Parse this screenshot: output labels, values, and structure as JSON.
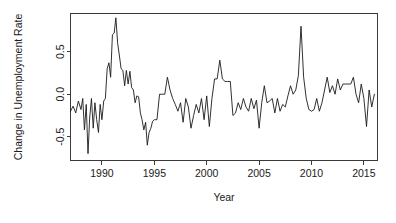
{
  "chart_data": {
    "type": "line",
    "title": "",
    "xlabel": "Year",
    "ylabel": "Change in Unemployment Rate",
    "xlim": [
      1987.0,
      2016.3
    ],
    "ylim": [
      -0.78,
      0.95
    ],
    "grid": false,
    "legend": null,
    "xticks": [
      1990,
      1995,
      2000,
      2005,
      2010,
      2015
    ],
    "xtick_labels": [
      "1990",
      "1995",
      "2000",
      "2005",
      "2010",
      "2015"
    ],
    "yticks": [
      -0.5,
      0.0,
      0.5
    ],
    "ytick_labels": [
      "-0.5",
      "0.0",
      "0.5"
    ],
    "line_color": "#1a1a1a",
    "series": [
      {
        "name": "Change in Unemployment Rate",
        "x": [
          1987.0,
          1987.25,
          1987.5,
          1987.75,
          1988.0,
          1988.17,
          1988.33,
          1988.5,
          1988.67,
          1988.83,
          1989.0,
          1989.17,
          1989.33,
          1989.5,
          1989.67,
          1989.83,
          1990.0,
          1990.17,
          1990.33,
          1990.5,
          1990.67,
          1990.83,
          1991.0,
          1991.17,
          1991.33,
          1991.5,
          1991.67,
          1991.83,
          1992.0,
          1992.17,
          1992.33,
          1992.5,
          1992.67,
          1992.83,
          1993.0,
          1993.17,
          1993.33,
          1993.5,
          1993.67,
          1993.83,
          1994.0,
          1994.17,
          1994.33,
          1994.5,
          1994.67,
          1994.83,
          1995.0,
          1995.25,
          1995.5,
          1995.75,
          1996.0,
          1996.25,
          1996.5,
          1996.75,
          1997.0,
          1997.25,
          1997.5,
          1997.75,
          1998.0,
          1998.25,
          1998.5,
          1998.75,
          1999.0,
          1999.25,
          1999.5,
          1999.75,
          2000.0,
          2000.25,
          2000.5,
          2000.75,
          2001.0,
          2001.25,
          2001.5,
          2001.75,
          2002.0,
          2002.25,
          2002.5,
          2002.75,
          2003.0,
          2003.25,
          2003.5,
          2003.75,
          2004.0,
          2004.25,
          2004.5,
          2004.75,
          2005.0,
          2005.25,
          2005.5,
          2005.75,
          2006.0,
          2006.25,
          2006.5,
          2006.75,
          2007.0,
          2007.25,
          2007.5,
          2007.75,
          2008.0,
          2008.25,
          2008.5,
          2008.75,
          2009.0,
          2009.25,
          2009.5,
          2009.75,
          2010.0,
          2010.25,
          2010.5,
          2010.75,
          2011.0,
          2011.25,
          2011.5,
          2011.75,
          2012.0,
          2012.25,
          2012.5,
          2012.75,
          2013.0,
          2013.25,
          2013.5,
          2013.75,
          2014.0,
          2014.25,
          2014.5,
          2014.75,
          2015.0,
          2015.25,
          2015.5,
          2015.75,
          2016.0
        ],
        "y": [
          -0.2,
          -0.14,
          -0.22,
          -0.08,
          -0.18,
          -0.05,
          -0.42,
          -0.12,
          -0.7,
          -0.28,
          -0.05,
          -0.4,
          -0.1,
          -0.3,
          -0.45,
          -0.12,
          -0.3,
          -0.08,
          -0.05,
          0.3,
          0.37,
          0.2,
          0.7,
          0.72,
          0.9,
          0.6,
          0.45,
          0.3,
          0.28,
          0.1,
          0.28,
          0.12,
          0.27,
          0.08,
          0.05,
          -0.1,
          -0.02,
          -0.03,
          -0.22,
          -0.3,
          -0.42,
          -0.33,
          -0.6,
          -0.45,
          -0.4,
          -0.32,
          -0.3,
          -0.3,
          0.0,
          0.0,
          0.0,
          0.2,
          0.05,
          -0.05,
          -0.12,
          -0.2,
          -0.1,
          -0.33,
          -0.05,
          -0.15,
          -0.4,
          -0.25,
          -0.12,
          -0.22,
          -0.05,
          -0.3,
          -0.02,
          -0.38,
          -0.05,
          0.18,
          0.18,
          0.4,
          0.18,
          0.15,
          0.15,
          0.15,
          -0.25,
          -0.22,
          -0.1,
          -0.18,
          -0.05,
          -0.15,
          -0.2,
          -0.05,
          -0.17,
          -0.07,
          -0.4,
          -0.1,
          0.1,
          -0.1,
          -0.08,
          -0.05,
          -0.22,
          -0.05,
          -0.2,
          -0.12,
          -0.15,
          -0.02,
          0.1,
          0.0,
          0.05,
          0.22,
          0.8,
          0.2,
          -0.05,
          -0.18,
          -0.2,
          -0.18,
          -0.05,
          -0.2,
          -0.1,
          0.05,
          0.2,
          0.02,
          0.1,
          0.0,
          0.18,
          0.05,
          0.12,
          0.12,
          0.12,
          0.12,
          0.2,
          0.0,
          -0.1,
          0.12,
          -0.05,
          -0.38,
          0.05,
          -0.15,
          0.0
        ]
      }
    ]
  },
  "axis": {
    "y_title": "Change in Unemployment Rate",
    "x_title": "Year"
  }
}
